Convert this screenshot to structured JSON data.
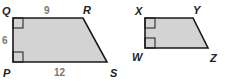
{
  "figure": {
    "fill_color": "#d3d3d3",
    "stroke_color": "#1a1a1a",
    "trapezoid_left": {
      "vertices": {
        "top_left": "Q",
        "top_right": "R",
        "bottom_right": "S",
        "bottom_left": "P"
      },
      "side_labels": {
        "top": "9",
        "left": "6",
        "bottom": "12"
      },
      "right_angles": [
        "Q",
        "P"
      ]
    },
    "trapezoid_right": {
      "vertices": {
        "top_left": "X",
        "top_right": "Y",
        "bottom_right": "Z",
        "bottom_left": "W"
      },
      "right_angles": [
        "X",
        "W"
      ]
    }
  }
}
